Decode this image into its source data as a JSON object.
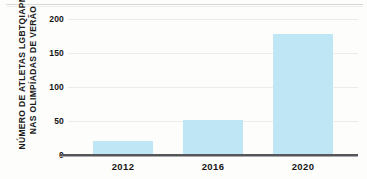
{
  "chart_data": {
    "type": "bar",
    "title": "",
    "subtitle": "",
    "xlabel": "",
    "ylabel": "NÚMERO DE ATLETAS LGBTQIAPN+ NAS OLIMPÍADAS DE VERÃO",
    "ylabel_lines": [
      "NÚMERO DE ATLETAS LGBTQIAPN+",
      "NAS OLIMPÍADAS DE VERÃO"
    ],
    "categories": [
      "2012",
      "2016",
      "2020"
    ],
    "values": [
      20,
      51,
      178
    ],
    "ylim": [
      0,
      200
    ],
    "yticks": [
      0,
      50,
      100,
      150,
      200
    ],
    "ytick_labels": [
      "0",
      "50",
      "100",
      "150",
      "200"
    ],
    "grid": true,
    "grid_axis": "y",
    "legend": false,
    "legend_position": "none",
    "bar_color": "#bfe6f5",
    "axis_color": "#56565a",
    "grid_color": "#ececea",
    "text_color": "#161616",
    "background_color": "#fdfdfc"
  }
}
